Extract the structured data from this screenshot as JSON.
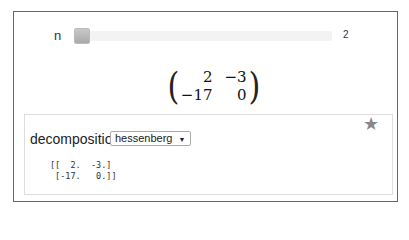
{
  "slider": {
    "label": "n",
    "value": "2"
  },
  "matrix": {
    "rows": [
      [
        "2",
        "−3"
      ],
      [
        "−17",
        "0"
      ]
    ]
  },
  "decomposition": {
    "label": "decomposition",
    "selected": "hessenberg",
    "arrow": "▼",
    "star": "★",
    "output": "[[  2.  -3.]\n [-17.   0.]]"
  }
}
